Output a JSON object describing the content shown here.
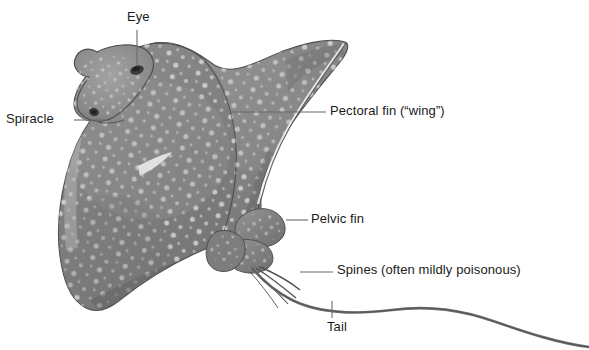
{
  "figure": {
    "background_color": "#ffffff",
    "body_color": "#8a8a8a",
    "body_shadow_color": "#6f6f6f",
    "body_highlight_color": "#b9b9b9",
    "spot_color": "#d8d8d8",
    "outline_color": "#4a4a4a",
    "leader_color": "#6b6b6b",
    "text_color": "#1a1a1a"
  },
  "labels": {
    "eye": "Eye",
    "spiracle": "Spiracle",
    "pectoral_fin": "Pectoral fin (“wing”)",
    "pelvic_fin": "Pelvic fin",
    "spines": "Spines (often mildly poisonous)",
    "tail": "Tail"
  },
  "leader_lines": [
    {
      "name": "eye-leader",
      "x1": 137,
      "y1": 30,
      "x2": 137,
      "y2": 67
    },
    {
      "name": "spiracle-leader",
      "x1": 74,
      "y1": 120,
      "x2": 108,
      "y2": 120
    },
    {
      "name": "pectoral-leader",
      "x1": 232,
      "y1": 112,
      "x2": 326,
      "y2": 112
    },
    {
      "name": "pelvic-leader",
      "x1": 286,
      "y1": 220,
      "x2": 308,
      "y2": 220
    },
    {
      "name": "spines-leader",
      "x1": 300,
      "y1": 272,
      "x2": 333,
      "y2": 272
    },
    {
      "name": "tail-leader",
      "x1": 332,
      "y1": 300,
      "x2": 332,
      "y2": 318
    }
  ]
}
